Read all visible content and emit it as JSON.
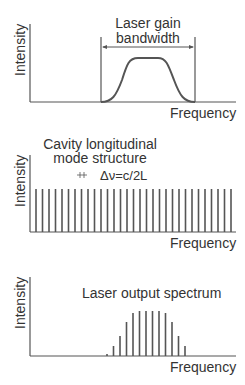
{
  "panels": [
    {
      "id": "gain",
      "ylabel": "Intensity",
      "xlabel": "Frequency",
      "title_line1": "Laser gain",
      "title_line2": "bandwidth"
    },
    {
      "id": "modes",
      "ylabel": "Intensity",
      "xlabel": "Frequency",
      "title_line1": "Cavity longitudinal",
      "title_line2": "mode structure",
      "spacing_label": "Δν=c/2L",
      "mode_count": 31
    },
    {
      "id": "output",
      "ylabel": "Intensity",
      "xlabel": "Frequency",
      "title_line1": "Laser output spectrum",
      "line_heights": [
        2,
        10,
        20,
        34,
        43,
        45,
        45,
        45,
        45,
        43,
        34,
        20,
        10
      ]
    }
  ],
  "colors": {
    "stroke": "#555555",
    "text": "#333333"
  }
}
